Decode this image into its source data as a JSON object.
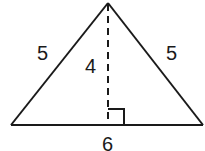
{
  "diagram": {
    "type": "isosceles-triangle",
    "stroke_color": "#1a1a1a",
    "background": "#ffffff",
    "vertices": {
      "apex": [
        108,
        3
      ],
      "left": [
        11,
        125
      ],
      "right": [
        203,
        125
      ]
    },
    "altitude": {
      "from": [
        108,
        3
      ],
      "to": [
        108,
        125
      ],
      "style": "dashed"
    },
    "right_angle_marker": {
      "x": 108,
      "y": 109,
      "size": 16
    },
    "labels": {
      "left_side": "5",
      "right_side": "5",
      "height": "4",
      "base": "6"
    }
  }
}
